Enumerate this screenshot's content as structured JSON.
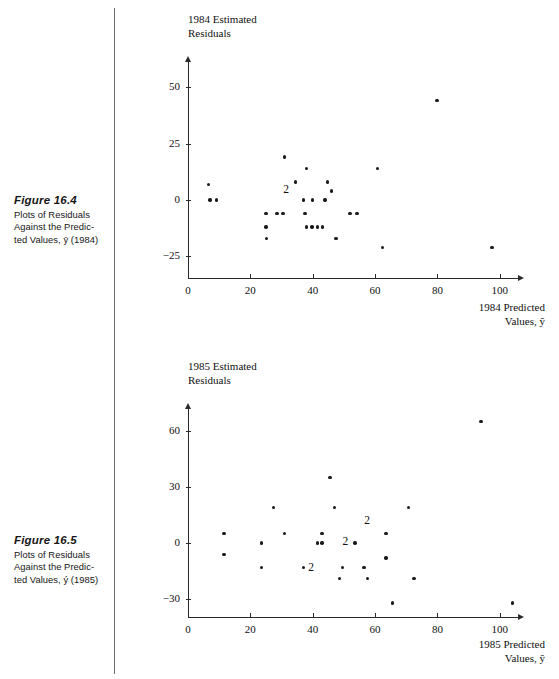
{
  "figures": [
    {
      "number": "Figure 16.4",
      "caption_lines": [
        "Plots of Residuals",
        "Against the Predic-",
        "ted Values, ȳ (1984)"
      ],
      "caption_text": "Plots of Residuals Against the Predicted Values, ȳ (1984)"
    },
    {
      "number": "Figure 16.5",
      "caption_lines": [
        "Plots of Residuals",
        "Against the Predic-",
        "ted Values, ý (1985)"
      ],
      "caption_text": "Plots of Residuals Against the Predicted Values, ý (1985)"
    }
  ],
  "chart_data": [
    {
      "type": "scatter",
      "title": "1984 Estimated Residuals",
      "ylabel_lines": [
        "1984 Estimated",
        "Residuals"
      ],
      "xlabel_lines": [
        "1984 Predicted",
        "Values, ŷ"
      ],
      "xlabel": "1984 Predicted Values, ŷ",
      "ylabel": "1984 Estimated Residuals",
      "xticks": [
        0,
        20,
        40,
        60,
        80,
        100
      ],
      "yticks": [
        -25,
        0,
        25,
        50
      ],
      "xlim": [
        0,
        108
      ],
      "ylim": [
        -28,
        58
      ],
      "grid": false,
      "legend": "none",
      "marker_color": "#1a1a1a",
      "points": [
        {
          "x": 6.5,
          "y": 7
        },
        {
          "x": 7.0,
          "y": 0
        },
        {
          "x": 9.2,
          "y": 0
        },
        {
          "x": 25.0,
          "y": -6
        },
        {
          "x": 25.0,
          "y": -12
        },
        {
          "x": 25.2,
          "y": -17
        },
        {
          "x": 28.5,
          "y": -6
        },
        {
          "x": 30.5,
          "y": -6
        },
        {
          "x": 31.0,
          "y": 19
        },
        {
          "x": 34.5,
          "y": 8
        },
        {
          "x": 37.0,
          "y": 0
        },
        {
          "x": 37.5,
          "y": -6
        },
        {
          "x": 38.0,
          "y": 14
        },
        {
          "x": 38.0,
          "y": -12
        },
        {
          "x": 39.8,
          "y": -12
        },
        {
          "x": 40.0,
          "y": 0
        },
        {
          "x": 41.5,
          "y": -12
        },
        {
          "x": 43.2,
          "y": -12
        },
        {
          "x": 44.0,
          "y": 0
        },
        {
          "x": 44.8,
          "y": 8
        },
        {
          "x": 46.0,
          "y": 4
        },
        {
          "x": 47.5,
          "y": -17
        },
        {
          "x": 52.0,
          "y": -6
        },
        {
          "x": 54.2,
          "y": -6
        },
        {
          "x": 60.8,
          "y": 14
        },
        {
          "x": 62.3,
          "y": -21
        },
        {
          "x": 79.8,
          "y": 44
        },
        {
          "x": 97.5,
          "y": -21
        }
      ],
      "overlap_labels": [
        {
          "x": 31.5,
          "y": 4,
          "label": "2"
        }
      ]
    },
    {
      "type": "scatter",
      "title": "1985 Estimated Residuals",
      "ylabel_lines": [
        "1985 Estimated",
        "Residuals"
      ],
      "xlabel_lines": [
        "1985 Predicted",
        "Values, ŷ"
      ],
      "xlabel": "1985 Predicted Values, ŷ",
      "ylabel": "1985 Estimated Residuals",
      "xticks": [
        0,
        20,
        40,
        60,
        80,
        100
      ],
      "yticks": [
        -30,
        0,
        30,
        60
      ],
      "xlim": [
        0,
        108
      ],
      "ylim": [
        -36,
        72
      ],
      "grid": false,
      "legend": "none",
      "marker_color": "#1a1a1a",
      "points": [
        {
          "x": 11.5,
          "y": 5
        },
        {
          "x": 11.5,
          "y": -6
        },
        {
          "x": 23.5,
          "y": 0
        },
        {
          "x": 23.5,
          "y": -13
        },
        {
          "x": 27.5,
          "y": 19
        },
        {
          "x": 31.0,
          "y": 5
        },
        {
          "x": 37.0,
          "y": -13
        },
        {
          "x": 41.5,
          "y": 0
        },
        {
          "x": 43.0,
          "y": 0
        },
        {
          "x": 43.0,
          "y": 5
        },
        {
          "x": 45.5,
          "y": 35
        },
        {
          "x": 47.0,
          "y": 19
        },
        {
          "x": 48.5,
          "y": -19
        },
        {
          "x": 49.5,
          "y": -13
        },
        {
          "x": 53.5,
          "y": 0
        },
        {
          "x": 56.5,
          "y": -13
        },
        {
          "x": 57.5,
          "y": -19
        },
        {
          "x": 63.5,
          "y": 5
        },
        {
          "x": 63.5,
          "y": -8
        },
        {
          "x": 65.5,
          "y": -32
        },
        {
          "x": 70.8,
          "y": 19
        },
        {
          "x": 72.5,
          "y": -19
        },
        {
          "x": 94.0,
          "y": 65
        },
        {
          "x": 104.0,
          "y": -32
        }
      ],
      "overlap_labels": [
        {
          "x": 57.5,
          "y": 11,
          "label": "2"
        },
        {
          "x": 50.5,
          "y": 0,
          "label": "2"
        },
        {
          "x": 39.5,
          "y": -14,
          "label": "2"
        }
      ]
    }
  ]
}
